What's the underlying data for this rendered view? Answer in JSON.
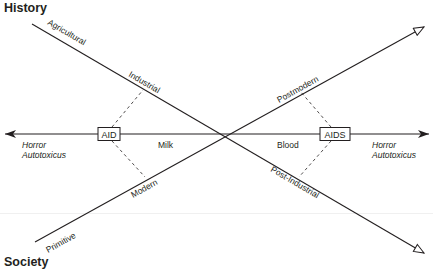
{
  "titles": {
    "top": "History",
    "bottom": "Society"
  },
  "axes": {
    "descending_line": {
      "labels": [
        "Agricultural",
        "Industrial",
        "Post-Industrial"
      ]
    },
    "ascending_line": {
      "labels": [
        "Primitive",
        "Modern",
        "Postmodern"
      ]
    },
    "horizontal_line": {
      "left_end_label": [
        "Horror",
        "Autotoxicus"
      ],
      "right_end_label": [
        "Horror",
        "Autotoxicus"
      ],
      "left_box": "AID",
      "right_box": "AIDS",
      "left_region": "Milk",
      "right_region": "Blood"
    }
  },
  "colors": {
    "ink": "#231f20",
    "background": "#ffffff"
  }
}
